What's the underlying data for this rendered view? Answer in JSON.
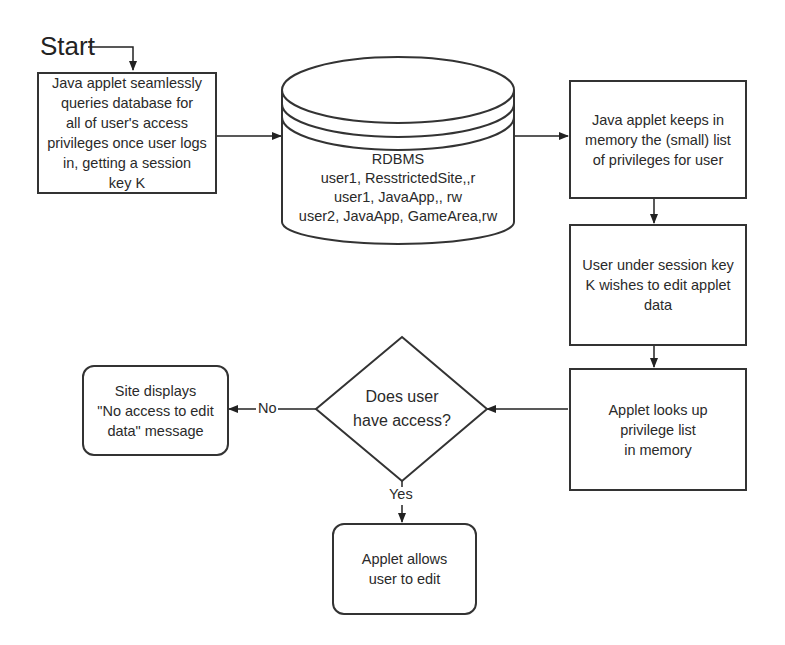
{
  "start_label": "Start",
  "nodes": {
    "query_db": {
      "lines": [
        "Java applet seamlessly",
        "queries database for",
        "all of user's access",
        "privileges once user logs",
        "in, getting a session",
        "key K"
      ]
    },
    "database": {
      "title": "RDBMS",
      "rows": [
        "user1, ResstrictedSite,,r",
        "user1, JavaApp,, rw",
        "user2, JavaApp, GameArea,rw"
      ]
    },
    "keep_in_memory": {
      "lines": [
        "Java applet keeps in",
        "memory the (small) list",
        "of privileges for user"
      ]
    },
    "wishes_to_edit": {
      "lines": [
        "User under session key",
        "K wishes to edit applet",
        "data"
      ]
    },
    "look_up": {
      "lines": [
        "Applet looks up",
        "privilege list",
        "in memory"
      ]
    },
    "decision": {
      "lines": [
        "Does user",
        "have access?"
      ]
    },
    "no_access": {
      "lines": [
        "Site displays",
        "\"No access to edit",
        "data\" message"
      ]
    },
    "allow_edit": {
      "lines": [
        "Applet allows",
        "user to edit"
      ]
    }
  },
  "edge_labels": {
    "no": "No",
    "yes": "Yes"
  },
  "colors": {
    "stroke": "#333333",
    "text": "#2a2a2a",
    "background": "#ffffff"
  }
}
